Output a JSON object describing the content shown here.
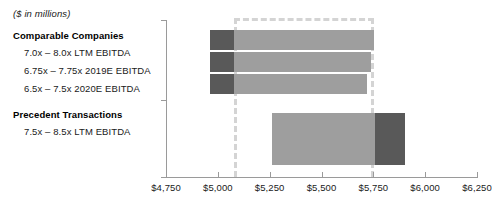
{
  "units_note": "($ in millions)",
  "groups": [
    {
      "name": "comparable-companies",
      "heading": "Comparable Companies",
      "lines": [
        "7.0x – 8.0x LTM EBITDA",
        "6.75x – 7.75x 2019E EBITDA",
        "6.5x – 7.5x 2020E EBITDA"
      ]
    },
    {
      "name": "precedent-transactions",
      "heading": "Precedent Transactions",
      "lines": [
        "7.5x – 8.5x LTM EBITDA"
      ]
    }
  ],
  "axis": {
    "ticks": [
      "$4,750",
      "$5,000",
      "$5,250",
      "$5,500",
      "$5,750",
      "$6,000",
      "$6,250"
    ],
    "min": 4750,
    "max": 6250,
    "step": 250
  },
  "colors": {
    "bar_light": "#9e9e9e",
    "bar_dark": "#595959",
    "reference_dash": "#d4d4d4",
    "axis": "#9a9a9a",
    "text": "#1a1a1a"
  },
  "chart_data": {
    "type": "bar",
    "orientation": "horizontal",
    "title": "",
    "subtitle": "($ in millions)",
    "xlabel": "",
    "ylabel": "",
    "xlim": [
      4750,
      6250
    ],
    "xtick_step": 250,
    "grid": false,
    "legend": "none",
    "value_unit": "$ in millions",
    "reference_band": {
      "low": 5080,
      "high": 5755
    },
    "categories": [
      "7.0x – 8.0x LTM EBITDA",
      "6.75x – 7.75x 2019E EBITDA",
      "6.5x – 7.5x 2020E EBITDA",
      "7.5x – 8.5x LTM EBITDA"
    ],
    "bars": [
      {
        "group": "Comparable Companies",
        "label": "7.0x – 8.0x LTM EBITDA",
        "low": 4960,
        "high": 5755,
        "dark_segment": {
          "low": 4960,
          "high": 5080,
          "side": "left"
        }
      },
      {
        "group": "Comparable Companies",
        "label": "6.75x – 7.75x 2019E EBITDA",
        "low": 4960,
        "high": 5740,
        "dark_segment": {
          "low": 4960,
          "high": 5080,
          "side": "left"
        }
      },
      {
        "group": "Comparable Companies",
        "label": "6.5x – 7.5x 2020E EBITDA",
        "low": 4960,
        "high": 5720,
        "dark_segment": {
          "low": 4960,
          "high": 5080,
          "side": "left"
        }
      },
      {
        "group": "Precedent Transactions",
        "label": "7.5x – 8.5x LTM EBITDA",
        "low": 5260,
        "high": 5905,
        "dark_segment": {
          "low": 5760,
          "high": 5905,
          "side": "right"
        }
      }
    ]
  }
}
